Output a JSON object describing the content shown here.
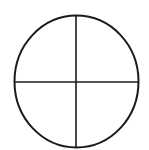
{
  "diagram": {
    "type": "circle-with-crosshair",
    "colors": {
      "stroke": "#1a1a1a",
      "background": "#ffffff"
    },
    "circle": {
      "cx": 76.5,
      "cy": 81.5,
      "rx": 62,
      "ry": 66,
      "stroke_width": 2
    },
    "vertical_line": {
      "x": 76,
      "y1": 15.5,
      "y2": 147.5,
      "stroke_width": 1.6
    },
    "horizontal_line": {
      "y": 82,
      "x1": 14.5,
      "x2": 138.5,
      "stroke_width": 1.6
    }
  }
}
